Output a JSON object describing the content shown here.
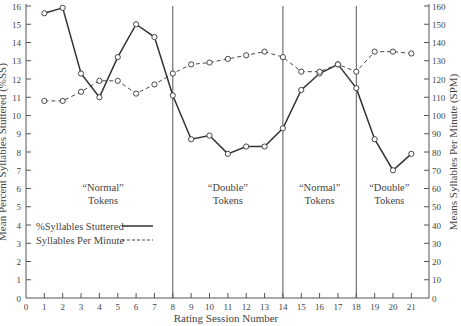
{
  "chart_data": {
    "type": "line",
    "title": "",
    "xlabel": "Rating Session Number",
    "ylabel_left": "Mean Percent Syllables Stuttered (%SS)",
    "ylabel_right": "Means Syllables Per Minute (SPM)",
    "x_ticks": [
      0,
      1,
      2,
      3,
      4,
      5,
      6,
      7,
      8,
      9,
      10,
      11,
      12,
      13,
      14,
      15,
      16,
      17,
      18,
      19,
      20,
      21
    ],
    "y_left_ticks": [
      0,
      1,
      2,
      3,
      4,
      5,
      6,
      7,
      8,
      9,
      10,
      11,
      12,
      13,
      14,
      15,
      16
    ],
    "y_right_ticks": [
      0,
      10,
      20,
      30,
      40,
      50,
      60,
      70,
      80,
      90,
      100,
      110,
      120,
      130,
      140,
      150,
      160
    ],
    "xlim": [
      0,
      22
    ],
    "ylim_left": [
      0,
      16
    ],
    "ylim_right": [
      0,
      160
    ],
    "grid": false,
    "x": [
      1,
      2,
      3,
      4,
      5,
      6,
      7,
      8,
      9,
      10,
      11,
      12,
      13,
      14,
      15,
      16,
      17,
      18,
      19,
      20,
      21
    ],
    "series": [
      {
        "name": "%Syllables Stuttered",
        "axis": "left",
        "line_style": "solid",
        "values": [
          15.6,
          15.9,
          12.3,
          11.0,
          13.2,
          15.0,
          14.3,
          11.1,
          8.7,
          8.9,
          7.9,
          8.3,
          8.3,
          9.3,
          11.4,
          12.3,
          12.8,
          11.5,
          8.7,
          7.0,
          7.9
        ]
      },
      {
        "name": "Syllables Per Minute",
        "axis": "right",
        "line_style": "dashed",
        "values": [
          108,
          108,
          113,
          119,
          119,
          112,
          117,
          123,
          128,
          129,
          131,
          133,
          135,
          132,
          124,
          124,
          128,
          124,
          135,
          135,
          134
        ]
      }
    ],
    "phase_dividers": [
      8,
      14,
      18
    ],
    "annotations": [
      {
        "label_line1": "“Normal”",
        "label_line2": "Tokens",
        "x_center": 4.2
      },
      {
        "label_line1": "“Double”",
        "label_line2": "Tokens",
        "x_center": 11
      },
      {
        "label_line1": "“Normal”",
        "label_line2": "Tokens",
        "x_center": 16
      },
      {
        "label_line1": "“Double”",
        "label_line2": "Tokens",
        "x_center": 19.8
      }
    ],
    "legend": {
      "position": "lower-left",
      "entries": [
        {
          "label": "%Syllables Stuttered",
          "style": "solid"
        },
        {
          "label": "Syllables Per Minute",
          "style": "dashed"
        }
      ]
    },
    "colors": {
      "line": "#333333",
      "axis": "#555555",
      "text": "#444444",
      "marker_fill": "#ffffff"
    }
  }
}
